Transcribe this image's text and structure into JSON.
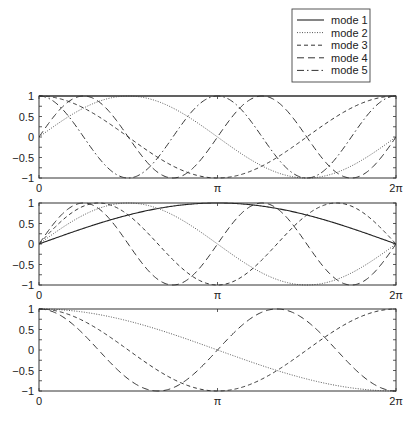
{
  "legend": {
    "box": {
      "x": 292,
      "y": 9,
      "w": 78,
      "h": 73
    },
    "entries": [
      {
        "label": "mode 1",
        "style": "solid"
      },
      {
        "label": "mode 2",
        "style": "dotted"
      },
      {
        "label": "mode 3",
        "style": "dashed"
      },
      {
        "label": "mode 4",
        "style": "longdash"
      },
      {
        "label": "mode 5",
        "style": "dashdot"
      }
    ]
  },
  "styles": {
    "solid": {
      "dash": "",
      "color": "#222222",
      "width": 1.1
    },
    "dotted": {
      "dash": "1,1.5",
      "color": "#555555",
      "width": 1.0
    },
    "dashed": {
      "dash": "4,3",
      "color": "#333333",
      "width": 1.0
    },
    "longdash": {
      "dash": "7,4",
      "color": "#333333",
      "width": 1.0
    },
    "dashdot": {
      "dash": "7,3,1.5,3",
      "color": "#333333",
      "width": 1.0
    }
  },
  "axes_layout": {
    "left": 39,
    "right": 396
  },
  "chart_data": [
    {
      "type": "line",
      "title": "",
      "xlabel": "",
      "ylabel": "",
      "xlim": [
        0,
        6.2832
      ],
      "ylim": [
        -1,
        1
      ],
      "xticks": [
        {
          "value": 0,
          "label": "0"
        },
        {
          "value": 3.1416,
          "label": "π"
        },
        {
          "value": 6.2832,
          "label": "2π"
        }
      ],
      "yticks": [
        {
          "value": 1,
          "label": "1"
        },
        {
          "value": 0.5,
          "label": "0.5"
        },
        {
          "value": 0,
          "label": "0"
        },
        {
          "value": -0.5,
          "label": "−0.5"
        },
        {
          "value": -1,
          "label": "−1"
        }
      ],
      "grid": false,
      "frame": {
        "top": 96,
        "bottom": 178
      },
      "series": [
        {
          "name": "mode 1",
          "style": "solid",
          "formula": "1",
          "fn": {
            "kind": "const",
            "a": 1
          }
        },
        {
          "name": "mode 2",
          "style": "dotted",
          "formula": "sin(x)",
          "fn": {
            "kind": "sin",
            "k": 1
          }
        },
        {
          "name": "mode 3",
          "style": "dashed",
          "formula": "cos(x)",
          "fn": {
            "kind": "cos",
            "k": 1
          }
        },
        {
          "name": "mode 4",
          "style": "longdash",
          "formula": "sin(2x)",
          "fn": {
            "kind": "sin",
            "k": 2
          }
        },
        {
          "name": "mode 5",
          "style": "dashdot",
          "formula": "cos(2x)",
          "fn": {
            "kind": "cos",
            "k": 2
          }
        }
      ]
    },
    {
      "type": "line",
      "title": "",
      "xlabel": "",
      "ylabel": "",
      "xlim": [
        0,
        6.2832
      ],
      "ylim": [
        -1,
        1
      ],
      "xticks": [
        {
          "value": 0,
          "label": "0"
        },
        {
          "value": 3.1416,
          "label": "π"
        },
        {
          "value": 6.2832,
          "label": "2π"
        }
      ],
      "yticks": [
        {
          "value": 1,
          "label": "1"
        },
        {
          "value": 0.5,
          "label": "0.5"
        },
        {
          "value": 0,
          "label": "0"
        },
        {
          "value": -0.5,
          "label": "−0.5"
        },
        {
          "value": -1,
          "label": "−1"
        }
      ],
      "grid": false,
      "frame": {
        "top": 203,
        "bottom": 285
      },
      "series": [
        {
          "name": "mode 1",
          "style": "solid",
          "formula": "sin(x/2)",
          "fn": {
            "kind": "sin",
            "k": 0.5
          }
        },
        {
          "name": "mode 2",
          "style": "dotted",
          "formula": "sin(x)",
          "fn": {
            "kind": "sin",
            "k": 1
          }
        },
        {
          "name": "mode 3",
          "style": "dashed",
          "formula": "sin(3x/2)",
          "fn": {
            "kind": "sin",
            "k": 1.5
          }
        },
        {
          "name": "mode 4",
          "style": "longdash",
          "formula": "sin(2x)",
          "fn": {
            "kind": "sin",
            "k": 2
          }
        }
      ]
    },
    {
      "type": "line",
      "title": "",
      "xlabel": "",
      "ylabel": "",
      "xlim": [
        0,
        6.2832
      ],
      "ylim": [
        -1,
        1
      ],
      "xticks": [
        {
          "value": 0,
          "label": "0"
        },
        {
          "value": 3.1416,
          "label": "π"
        },
        {
          "value": 6.2832,
          "label": "2π"
        }
      ],
      "yticks": [
        {
          "value": 1,
          "label": "1"
        },
        {
          "value": 0.5,
          "label": "0.5"
        },
        {
          "value": 0,
          "label": "0"
        },
        {
          "value": -0.5,
          "label": "−0.5"
        },
        {
          "value": -1,
          "label": "−1"
        }
      ],
      "grid": false,
      "frame": {
        "top": 309,
        "bottom": 391
      },
      "series": [
        {
          "name": "mode 2",
          "style": "dotted",
          "formula": "cos(x/2)",
          "fn": {
            "kind": "cos",
            "k": 0.5
          }
        },
        {
          "name": "mode 3",
          "style": "dashed",
          "formula": "cos(x)",
          "fn": {
            "kind": "cos",
            "k": 1
          }
        },
        {
          "name": "mode 4",
          "style": "longdash",
          "formula": "cos(3x/2)",
          "fn": {
            "kind": "cos",
            "k": 1.5
          }
        }
      ]
    }
  ]
}
